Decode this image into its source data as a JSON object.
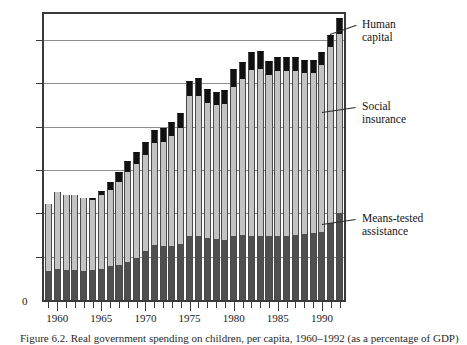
{
  "figure": {
    "caption": "Figure 6.2.  Real government spending on children, per capita, 1960–1992 (as a percentage of GDP)"
  },
  "callouts": [
    {
      "id": "human-capital",
      "label": "Human\ncapital",
      "color": "#111111"
    },
    {
      "id": "social-insurance",
      "label": "Social\ninsurance",
      "color": "#c3c3c3"
    },
    {
      "id": "means-tested",
      "label": "Means-tested\nassistance",
      "color": "#4f4f4f"
    }
  ],
  "chart_data": {
    "type": "bar",
    "stacked": true,
    "title": "",
    "xlabel": "",
    "ylabel": "",
    "ylim": [
      0,
      13.2
    ],
    "yticks": [
      0,
      2,
      4,
      6,
      8,
      10,
      12
    ],
    "ytick_labels": [
      "0",
      "2%",
      "4%",
      "6%",
      "8%",
      "10%",
      "12%"
    ],
    "grid": true,
    "grid_axis": "y",
    "xlim": [
      1958.5,
      1992.5
    ],
    "xticks": [
      1960,
      1965,
      1970,
      1975,
      1980,
      1985,
      1990
    ],
    "xtick_labels": [
      "1960",
      "1965",
      "1970",
      "1975",
      "1980",
      "1985",
      "1990"
    ],
    "legend_position": "right-callouts",
    "categories": [
      1959,
      1960,
      1961,
      1962,
      1963,
      1964,
      1965,
      1966,
      1967,
      1968,
      1969,
      1970,
      1971,
      1972,
      1973,
      1974,
      1975,
      1976,
      1977,
      1978,
      1979,
      1980,
      1981,
      1982,
      1983,
      1984,
      1985,
      1986,
      1987,
      1988,
      1989,
      1990,
      1991,
      1992
    ],
    "series": [
      {
        "name": "Means-tested assistance",
        "color": "#4f4f4f",
        "values": [
          1.35,
          1.45,
          1.4,
          1.38,
          1.35,
          1.4,
          1.45,
          1.55,
          1.6,
          1.75,
          1.95,
          2.25,
          2.55,
          2.5,
          2.5,
          2.6,
          2.95,
          2.95,
          2.85,
          2.8,
          2.75,
          2.95,
          3.0,
          2.95,
          2.95,
          2.95,
          2.95,
          2.95,
          3.0,
          3.05,
          3.1,
          3.15,
          3.55,
          4.0
        ]
      },
      {
        "name": "Social insurance",
        "color": "#c3c3c3",
        "values": [
          3.1,
          3.55,
          3.45,
          3.45,
          3.35,
          3.2,
          3.4,
          3.55,
          3.85,
          4.15,
          4.35,
          4.45,
          4.7,
          4.8,
          5.05,
          5.35,
          6.45,
          6.45,
          6.25,
          6.2,
          6.3,
          6.9,
          7.2,
          7.65,
          7.7,
          7.45,
          7.6,
          7.6,
          7.55,
          7.45,
          7.4,
          7.7,
          8.15,
          8.3
        ]
      },
      {
        "name": "Human capital",
        "color": "#111111",
        "values": [
          0.0,
          0.0,
          0.0,
          0.0,
          0.0,
          0.1,
          0.2,
          0.35,
          0.45,
          0.5,
          0.55,
          0.6,
          0.6,
          0.65,
          0.65,
          0.7,
          0.7,
          0.85,
          0.65,
          0.6,
          0.65,
          0.8,
          0.8,
          0.85,
          0.85,
          0.65,
          0.65,
          0.65,
          0.65,
          0.6,
          0.6,
          0.6,
          0.55,
          0.7
        ]
      }
    ]
  }
}
